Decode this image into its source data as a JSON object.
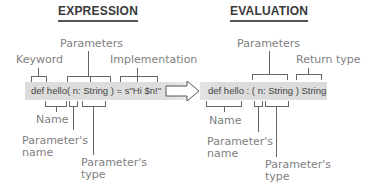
{
  "expression": {
    "heading": "EXPRESSION",
    "code": "def hello( n: String ) = s\"Hi $n!\"",
    "labels": {
      "keyword": "Keyword",
      "parameters": "Parameters",
      "implementation": "Implementation",
      "name": "Name",
      "param_name_1": "Parameter's",
      "param_name_2": "name",
      "param_type_1": "Parameter's",
      "param_type_2": "type"
    }
  },
  "evaluation": {
    "heading": "EVALUATION",
    "code": "def hello : ( n: String ) String",
    "labels": {
      "parameters": "Parameters",
      "return_type": "Return type",
      "name": "Name",
      "param_name_1": "Parameter's",
      "param_name_2": "name",
      "param_type_1": "Parameter's",
      "param_type_2": "type"
    }
  },
  "arrow": {
    "icon": "right-arrow-outline-icon"
  }
}
